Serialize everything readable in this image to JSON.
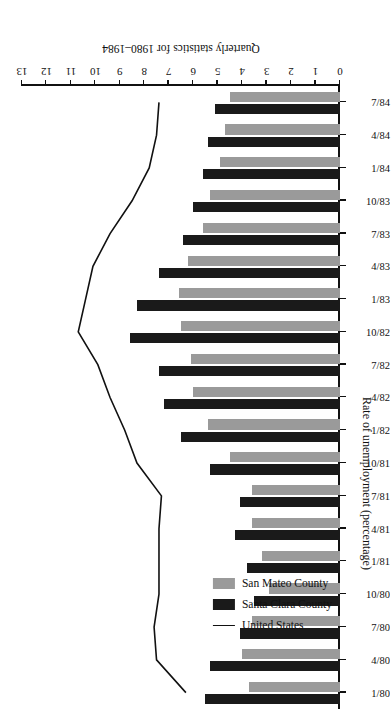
{
  "chart_data": {
    "type": "bar",
    "title": "",
    "caption": "Quarterly statistics for 1980–1984",
    "xlabel": "",
    "ylabel": "Rate of unemployment (percentage)",
    "ylim": [
      0,
      13
    ],
    "ytick_labels": [
      "0",
      "1",
      "2",
      "3",
      "4",
      "5",
      "6",
      "7",
      "8",
      "9",
      "10",
      "11",
      "12",
      "13"
    ],
    "yticks": [
      0,
      1,
      2,
      3,
      4,
      5,
      6,
      7,
      8,
      9,
      10,
      11,
      12,
      13
    ],
    "grid": false,
    "orientation": "horizontal-bars-rotated-180",
    "legend_position": "upper-left",
    "categories": [
      "1/80",
      "4/80",
      "7/80",
      "10/80",
      "1/81",
      "4/81",
      "7/81",
      "10/81",
      "1/82",
      "4/82",
      "7/82",
      "10/82",
      "1/83",
      "4/83",
      "7/83",
      "10/83",
      "1/84",
      "4/84",
      "7/84"
    ],
    "series": [
      {
        "name": "Santa Clara County",
        "kind": "bar",
        "color": "#1a1a1a",
        "values": [
          5.5,
          5.3,
          4.1,
          3.5,
          3.8,
          4.3,
          4.1,
          5.3,
          6.5,
          7.2,
          7.4,
          8.6,
          8.3,
          7.4,
          6.4,
          6.0,
          5.6,
          5.4,
          5.1
        ]
      },
      {
        "name": "San Mateo County",
        "kind": "bar",
        "color": "#9a9a9a",
        "values": [
          3.7,
          4.0,
          3.6,
          2.9,
          3.2,
          3.6,
          3.6,
          4.5,
          5.4,
          6.0,
          6.1,
          6.5,
          6.6,
          6.2,
          5.6,
          5.3,
          4.9,
          4.7,
          4.5
        ]
      },
      {
        "name": "United States",
        "kind": "line",
        "color": "#111111",
        "values": [
          6.3,
          7.5,
          7.6,
          7.4,
          7.4,
          7.4,
          7.3,
          8.3,
          8.8,
          9.4,
          9.9,
          10.7,
          10.4,
          10.1,
          9.4,
          8.5,
          7.8,
          7.5,
          7.4
        ]
      }
    ]
  },
  "legend": {
    "items": [
      {
        "label": "United States",
        "swatch": "line"
      },
      {
        "label": "Santa Clara County",
        "swatch": "dark"
      },
      {
        "label": "San Mateo County",
        "swatch": "gray"
      }
    ]
  },
  "axes": {
    "value_axis_title": "Rate of unemployment (percentage)",
    "caption": "Quarterly statistics for 1980–1984"
  },
  "colors": {
    "santa_clara": "#1a1a1a",
    "san_mateo": "#9a9a9a",
    "united_states": "#111111",
    "background": "#ffffff"
  }
}
